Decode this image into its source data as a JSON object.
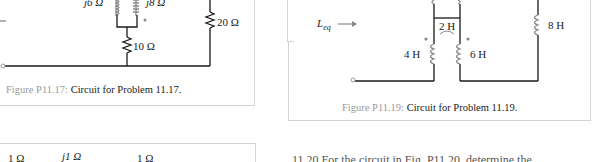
{
  "figures": [
    {
      "id": "P11.17",
      "caption_label": "Figure P11.17:",
      "caption_text": "Circuit for Problem 11.17.",
      "components": {
        "coil_left": "j6 Ω",
        "coil_right": "j8 Ω",
        "resistor_bottom": "10 Ω",
        "resistor_right": "20 Ω"
      }
    },
    {
      "id": "P11.19",
      "caption_label": "Figure P11.19:",
      "caption_text": "Circuit for Problem 11.19.",
      "components": {
        "input_label": "L",
        "input_subscript": "eq",
        "mutual": "2 H",
        "coil_left": "4 H",
        "coil_right": "6 H",
        "coil_far_right": "8 H"
      }
    }
  ],
  "bottom_left_partial": {
    "labels": [
      "1 Ω",
      "j1 Ω",
      "1 Ω"
    ]
  },
  "bottom_right_partial": {
    "text": "11.20  For the circuit in Fig. P11.20, determine the ..."
  },
  "colors": {
    "figure_label": "#9a9a9a",
    "border": "#d4d4d4",
    "wire": "#1a1a1a",
    "coil": "#8a8a8a"
  }
}
